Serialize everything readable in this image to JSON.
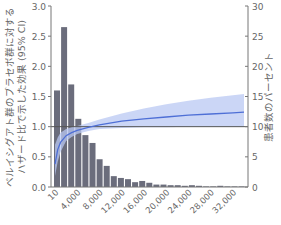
{
  "chart_data": {
    "type": "bar+line",
    "title": "",
    "xlabel": "",
    "ylabel_left": [
      "ベルイシグアト群のプラセボ群に対する",
      "ハザード比で示した効果 (95% CI)"
    ],
    "ylabel_right": "患者数のパーセント",
    "left_axis": {
      "ylim": [
        0,
        3.0
      ],
      "ticks": [
        "0.0",
        "0.5",
        "1.0",
        "1.5",
        "2.0",
        "2.5",
        "3.0"
      ]
    },
    "right_axis": {
      "ylim": [
        0,
        30
      ],
      "ticks": [
        "0",
        "5",
        "10",
        "15",
        "20",
        "25",
        "30"
      ]
    },
    "x_axis": {
      "xlim": [
        10,
        34000
      ],
      "ticks": [
        "10",
        "4,000",
        "8,000",
        "12,000",
        "16,000",
        "20,000",
        "24,000",
        "28,000",
        "32,000"
      ],
      "tick_values": [
        10,
        4000,
        8000,
        12000,
        16000,
        20000,
        24000,
        28000,
        32000
      ]
    },
    "reference_line": {
      "axis": "left",
      "y": 1.0
    },
    "histogram": {
      "name": "患者数のパーセント",
      "axis": "right",
      "bin_width": 1000,
      "values": [
        16.0,
        26.5,
        17.0,
        11.3,
        8.6,
        7.3,
        4.6,
        3.5,
        1.8,
        1.5,
        1.3,
        0.8,
        1.0,
        0.7,
        0.4,
        0.4,
        0.3,
        0.3,
        0.2,
        0.3,
        0.2,
        0.1,
        0.1,
        0.2,
        0.1,
        0.1,
        0.1,
        0.1,
        0.1,
        0.1,
        0.1,
        0.1
      ]
    },
    "series": [
      {
        "name": "Hazard ratio",
        "axis": "left",
        "x": [
          10,
          500,
          1000,
          2000,
          3000,
          4000,
          6000,
          8000,
          12000,
          16000,
          20000,
          24000,
          28000,
          32000,
          34000
        ],
        "values": [
          0.38,
          0.62,
          0.74,
          0.85,
          0.9,
          0.94,
          0.99,
          1.03,
          1.09,
          1.13,
          1.16,
          1.19,
          1.21,
          1.23,
          1.24
        ],
        "ci_lower": [
          0.18,
          0.42,
          0.58,
          0.76,
          0.83,
          0.88,
          0.93,
          0.96,
          0.98,
          0.99,
          0.99,
          1.0,
          1.0,
          1.0,
          1.0
        ],
        "ci_upper": [
          0.7,
          0.82,
          0.9,
          0.96,
          0.99,
          1.01,
          1.06,
          1.12,
          1.22,
          1.3,
          1.37,
          1.43,
          1.48,
          1.52,
          1.54
        ]
      }
    ],
    "colors": {
      "bars": "#6b6d7c",
      "line": "#4e6fd6",
      "band": "#b9c8f3",
      "reference": "#555555",
      "axis": "#777777"
    },
    "grid": false,
    "legend": null
  }
}
